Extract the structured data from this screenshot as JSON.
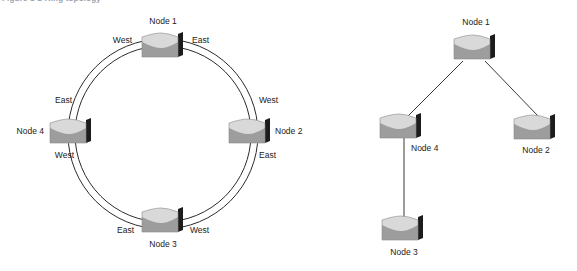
{
  "figure": {
    "caption": "Figure 1-2   Ring topology"
  },
  "colors": {
    "background": "#ffffff",
    "line": "#2b2b2b",
    "node_top": "#d7d7d7",
    "node_body": "#9d9d9d",
    "node_side": "#1c1c1c",
    "text": "#1a1a1a"
  },
  "diagrams": [
    {
      "id": "ring-diagram",
      "name": "ring-topology",
      "type": "ring",
      "link_style": "double-line",
      "nodes": [
        {
          "id": "node1",
          "label": "Node 1",
          "label_position": "top",
          "x": 140,
          "y": 31,
          "ports": [
            {
              "label": "West",
              "side": "left"
            },
            {
              "label": "East",
              "side": "right"
            }
          ]
        },
        {
          "id": "node2",
          "label": "Node 2",
          "label_position": "right",
          "x": 227,
          "y": 117,
          "ports": [
            {
              "label": "West",
              "side": "top"
            },
            {
              "label": "East",
              "side": "bottom"
            }
          ]
        },
        {
          "id": "node3",
          "label": "Node 3",
          "label_position": "bottom",
          "x": 140,
          "y": 206,
          "ports": [
            {
              "label": "East",
              "side": "left"
            },
            {
              "label": "West",
              "side": "right"
            }
          ]
        },
        {
          "id": "node4",
          "label": "Node 4",
          "label_position": "left",
          "x": 48,
          "y": 117,
          "ports": [
            {
              "label": "East",
              "side": "top"
            },
            {
              "label": "West",
              "side": "bottom"
            }
          ]
        }
      ],
      "links": [
        {
          "from": "node1",
          "to": "node2"
        },
        {
          "from": "node2",
          "to": "node3"
        },
        {
          "from": "node3",
          "to": "node4"
        },
        {
          "from": "node4",
          "to": "node1"
        }
      ]
    },
    {
      "id": "star-diagram",
      "name": "tree-topology",
      "type": "tree",
      "link_style": "single-line",
      "nodes": [
        {
          "id": "node1",
          "label": "Node 1",
          "label_position": "top",
          "x": 122,
          "y": 33,
          "ports": []
        },
        {
          "id": "node4",
          "label": "Node 4",
          "label_position": "bottom-right",
          "x": 48,
          "y": 112,
          "ports": []
        },
        {
          "id": "node2",
          "label": "Node 2",
          "label_position": "bottom",
          "x": 182,
          "y": 113,
          "ports": []
        },
        {
          "id": "node3",
          "label": "Node 3",
          "label_position": "bottom",
          "x": 50,
          "y": 214,
          "ports": []
        }
      ],
      "links": [
        {
          "from": "node1",
          "to": "node4"
        },
        {
          "from": "node1",
          "to": "node2"
        },
        {
          "from": "node4",
          "to": "node3"
        }
      ]
    }
  ]
}
